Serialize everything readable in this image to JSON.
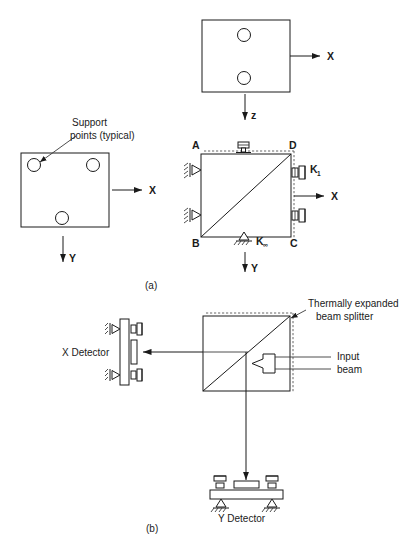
{
  "figure": {
    "caption_a": "(a)",
    "caption_b": "(b)"
  },
  "panel_a": {
    "top_plate": {
      "axis_x_label": "X",
      "axis_z_label": "z"
    },
    "left_plate": {
      "callout_line1": "Support",
      "callout_line2": "points (typical)",
      "axis_x_label": "X",
      "axis_y_label": "Y"
    },
    "mount_plate": {
      "corner_a": "A",
      "corner_b": "B",
      "corner_c": "C",
      "corner_d": "D",
      "spring_label": "K",
      "spring_sub": "1",
      "base_label": "K",
      "base_sub": "∞",
      "axis_x_label": "X",
      "axis_y_label": "Y"
    }
  },
  "panel_b": {
    "splitter_callout_line1": "Thermally expanded",
    "splitter_callout_line2": "beam splitter",
    "input_callout_line1": "Input",
    "input_callout_line2": "beam",
    "x_detector_label": "X Detector",
    "y_detector_label": "Y Detector"
  },
  "colors": {
    "ink": "#1a1a1a",
    "background": "#ffffff",
    "dashed": "#555555"
  }
}
